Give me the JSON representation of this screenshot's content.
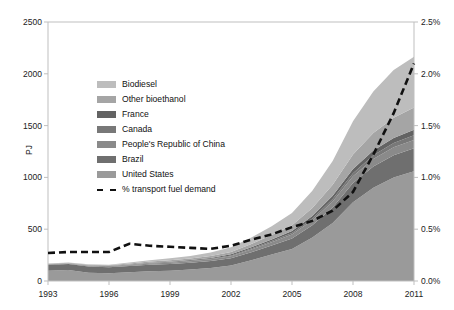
{
  "chart_data": {
    "type": "area",
    "title": "",
    "subtitle": "",
    "xlabel": "",
    "ylabel": "PJ",
    "ylabel_right": "",
    "grid": false,
    "legend_position": "inside-upper-left",
    "stacked": true,
    "x": [
      1993,
      1994,
      1995,
      1996,
      1997,
      1998,
      1999,
      2000,
      2001,
      2002,
      2003,
      2004,
      2005,
      2006,
      2007,
      2008,
      2009,
      2010,
      2011
    ],
    "xtick_labels": [
      "1993",
      "1996",
      "1999",
      "2002",
      "2005",
      "2008",
      "2011"
    ],
    "xtick_values": [
      1993,
      1996,
      1999,
      2002,
      2005,
      2008,
      2011
    ],
    "xlim": [
      1993,
      2011
    ],
    "ylim": [
      0,
      2500
    ],
    "ytick_labels": [
      "0",
      "500",
      "1000",
      "1500",
      "2000",
      "2500"
    ],
    "ytick_values": [
      0,
      500,
      1000,
      1500,
      2000,
      2500
    ],
    "ylim_right": [
      0,
      2.5
    ],
    "ytick_labels_right": [
      "0.0%",
      "0.5%",
      "1.0%",
      "1.5%",
      "2.0%",
      "2.5%"
    ],
    "ytick_values_right": [
      0,
      0.5,
      1.0,
      1.5,
      2.0,
      2.5
    ],
    "series": [
      {
        "name": "United States",
        "color": "#9a9a9a",
        "axis": "left",
        "values": [
          100,
          105,
          80,
          75,
          85,
          95,
          100,
          110,
          125,
          150,
          200,
          255,
          310,
          420,
          560,
          760,
          900,
          1000,
          1060
        ]
      },
      {
        "name": "Brazil",
        "color": "#6f6f6f",
        "axis": "left",
        "values": [
          55,
          58,
          60,
          58,
          60,
          63,
          65,
          66,
          68,
          70,
          78,
          88,
          100,
          118,
          150,
          185,
          205,
          215,
          222
        ]
      },
      {
        "name": "People's Republic of China",
        "color": "#8a8a8a",
        "axis": "left",
        "values": [
          3,
          4,
          5,
          6,
          8,
          10,
          12,
          14,
          16,
          20,
          26,
          32,
          40,
          48,
          58,
          66,
          72,
          76,
          80
        ]
      },
      {
        "name": "Canada",
        "color": "#787878",
        "axis": "left",
        "values": [
          1,
          1,
          2,
          2,
          3,
          3,
          4,
          5,
          6,
          7,
          9,
          11,
          14,
          18,
          24,
          30,
          36,
          40,
          44
        ]
      },
      {
        "name": "France",
        "color": "#636363",
        "axis": "left",
        "values": [
          2,
          2,
          3,
          3,
          4,
          5,
          6,
          7,
          8,
          10,
          12,
          15,
          19,
          24,
          32,
          40,
          46,
          50,
          54
        ]
      },
      {
        "name": "Other bioethanol",
        "color": "#a5a5a5",
        "axis": "left",
        "values": [
          5,
          6,
          7,
          8,
          10,
          12,
          14,
          16,
          19,
          24,
          32,
          42,
          56,
          76,
          104,
          140,
          170,
          195,
          215
        ]
      },
      {
        "name": "Biodiesel",
        "color": "#bdbdbd",
        "axis": "left",
        "values": [
          2,
          3,
          4,
          6,
          9,
          13,
          18,
          24,
          32,
          44,
          62,
          86,
          118,
          166,
          230,
          320,
          400,
          460,
          490
        ]
      }
    ],
    "overlay_line": {
      "name": "% transport fuel demand",
      "axis": "right",
      "style": "dashed",
      "color": "#111111",
      "values": [
        0.27,
        0.28,
        0.28,
        0.28,
        0.36,
        0.34,
        0.33,
        0.32,
        0.31,
        0.34,
        0.4,
        0.45,
        0.52,
        0.58,
        0.68,
        0.86,
        1.22,
        1.62,
        2.1
      ]
    },
    "legend_entries": [
      {
        "label": "Biodiesel",
        "swatch": "#bdbdbd",
        "type": "area"
      },
      {
        "label": "Other bioethanol",
        "swatch": "#a5a5a5",
        "type": "area"
      },
      {
        "label": "France",
        "swatch": "#636363",
        "type": "area"
      },
      {
        "label": "Canada",
        "swatch": "#787878",
        "type": "area"
      },
      {
        "label": "People's Republic of China",
        "swatch": "#8a8a8a",
        "type": "area"
      },
      {
        "label": "Brazil",
        "swatch": "#6f6f6f",
        "type": "area"
      },
      {
        "label": "United States",
        "swatch": "#9a9a9a",
        "type": "area"
      },
      {
        "label": "% transport fuel demand",
        "swatch": "#111111",
        "type": "dashed-line"
      }
    ],
    "colors": {
      "background": "#ffffff",
      "axis": "#bfbfbf",
      "text": "#1a1a1a",
      "overlay": "#111111"
    }
  }
}
